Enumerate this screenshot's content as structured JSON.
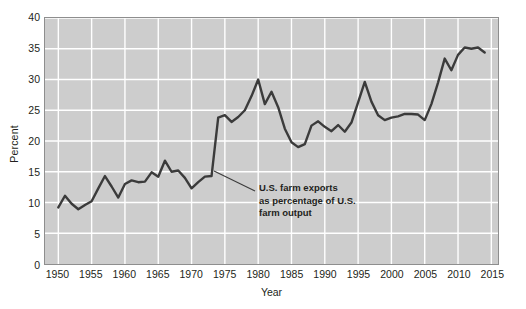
{
  "chart_data": {
    "type": "line",
    "title": "",
    "xlabel": "Year",
    "ylabel": "Percent",
    "xlim": [
      1948,
      2016
    ],
    "ylim": [
      0,
      40
    ],
    "grid": true,
    "legend": "none",
    "x_ticks": [
      1950,
      1955,
      1960,
      1965,
      1970,
      1975,
      1980,
      1985,
      1990,
      1995,
      2000,
      2005,
      2010,
      2015
    ],
    "y_ticks": [
      0,
      5,
      10,
      15,
      20,
      25,
      30,
      35,
      40
    ],
    "series": [
      {
        "name": "U.S. farm exports as percentage of U.S. farm output",
        "color": "#3b3b3b",
        "x": [
          1950,
          1951,
          1952,
          1953,
          1954,
          1955,
          1956,
          1957,
          1958,
          1959,
          1960,
          1961,
          1962,
          1963,
          1964,
          1965,
          1966,
          1967,
          1968,
          1969,
          1970,
          1971,
          1972,
          1973,
          1974,
          1975,
          1976,
          1977,
          1978,
          1979,
          1980,
          1981,
          1982,
          1983,
          1984,
          1985,
          1986,
          1987,
          1988,
          1989,
          1990,
          1991,
          1992,
          1993,
          1994,
          1995,
          1996,
          1997,
          1998,
          1999,
          2000,
          2001,
          2002,
          2003,
          2004,
          2005,
          2006,
          2007,
          2008,
          2009,
          2010,
          2011,
          2012,
          2013,
          2014
        ],
        "values": [
          9.2,
          11.1,
          9.8,
          8.9,
          9.6,
          10.2,
          12.3,
          14.3,
          12.6,
          10.8,
          13.0,
          13.6,
          13.3,
          13.4,
          14.9,
          14.2,
          16.8,
          15.0,
          15.2,
          14.0,
          12.3,
          13.3,
          14.2,
          14.3,
          23.8,
          24.2,
          23.1,
          23.9,
          25.0,
          27.3,
          30.0,
          26.0,
          28.0,
          25.5,
          22.0,
          19.8,
          19.0,
          19.5,
          22.5,
          23.2,
          22.3,
          21.6,
          22.6,
          21.5,
          23.0,
          26.3,
          29.6,
          26.4,
          24.2,
          23.4,
          23.8,
          24.0,
          24.4,
          24.4,
          24.3,
          23.4,
          26.0,
          29.5,
          33.4,
          31.5,
          34.0,
          35.2,
          35.0,
          35.2,
          34.4
        ]
      }
    ],
    "annotations": [
      {
        "name": "series-callout",
        "lines": [
          "U.S. farm exports",
          "as percentage of U.S.",
          "farm output"
        ],
        "leader_from": {
          "x": 214,
          "y": 171
        },
        "leader_to": {
          "x": 255,
          "y": 191
        }
      }
    ],
    "colors": {
      "plot_background": "#cdcdcd",
      "gridlines": "#ffffff",
      "frame": "#8e8e8e",
      "line": "#3b3b3b",
      "text": "#231f20",
      "page_background": "#ffffff"
    }
  }
}
